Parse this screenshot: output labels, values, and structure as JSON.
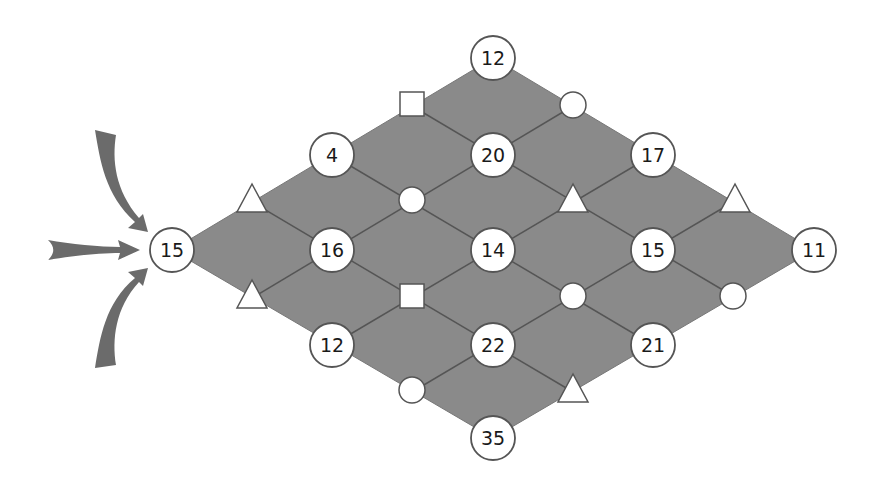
{
  "colors": {
    "background": "#ffffff",
    "board_fill": "#8a8a8a",
    "grid_line": "#555555",
    "node_fill": "#ffffff",
    "node_stroke": "#555555",
    "arrow_fill": "#6b6b6b",
    "text": "#1a1a1a"
  },
  "start_node": {
    "label": "15",
    "x": 172,
    "y": 250
  },
  "entry_arrows": [
    {
      "name": "arrow-from-top",
      "direction": "curved-down-right"
    },
    {
      "name": "arrow-from-left",
      "direction": "straight-right"
    },
    {
      "name": "arrow-from-bottom",
      "direction": "curved-up-right"
    }
  ],
  "number_nodes": [
    {
      "label": "15",
      "x": 172,
      "y": 250
    },
    {
      "label": "4",
      "x": 332,
      "y": 155
    },
    {
      "label": "16",
      "x": 332,
      "y": 250
    },
    {
      "label": "12",
      "x": 332,
      "y": 345
    },
    {
      "label": "12",
      "x": 493,
      "y": 58
    },
    {
      "label": "20",
      "x": 493,
      "y": 155
    },
    {
      "label": "14",
      "x": 493,
      "y": 250
    },
    {
      "label": "22",
      "x": 493,
      "y": 345
    },
    {
      "label": "35",
      "x": 493,
      "y": 438
    },
    {
      "label": "17",
      "x": 653,
      "y": 155
    },
    {
      "label": "15",
      "x": 653,
      "y": 250
    },
    {
      "label": "21",
      "x": 653,
      "y": 345
    },
    {
      "label": "11",
      "x": 814,
      "y": 250
    }
  ],
  "symbol_nodes": [
    {
      "shape": "triangle",
      "x": 252,
      "y": 200
    },
    {
      "shape": "triangle",
      "x": 252,
      "y": 296
    },
    {
      "shape": "square",
      "x": 412,
      "y": 104
    },
    {
      "shape": "circle",
      "x": 412,
      "y": 200
    },
    {
      "shape": "square",
      "x": 412,
      "y": 296
    },
    {
      "shape": "circle",
      "x": 412,
      "y": 390
    },
    {
      "shape": "circle",
      "x": 573,
      "y": 105
    },
    {
      "shape": "triangle",
      "x": 573,
      "y": 200
    },
    {
      "shape": "circle",
      "x": 573,
      "y": 296
    },
    {
      "shape": "triangle",
      "x": 573,
      "y": 390
    },
    {
      "shape": "triangle",
      "x": 735,
      "y": 200
    },
    {
      "shape": "circle",
      "x": 733,
      "y": 296
    }
  ]
}
